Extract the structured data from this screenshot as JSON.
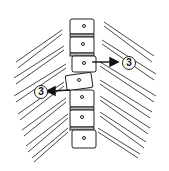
{
  "diagram": {
    "colors": {
      "line": "#222222",
      "background": "#ffffff"
    },
    "vertebrae_count": 7,
    "callouts": [
      {
        "id": "right",
        "text": "3",
        "arrow_direction": "right"
      },
      {
        "id": "left",
        "text": "3",
        "arrow_direction": "left"
      }
    ]
  }
}
